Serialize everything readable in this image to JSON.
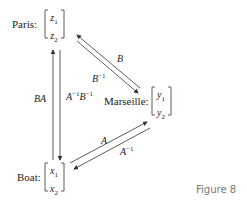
{
  "nodes": {
    "paris": {
      "label": "Paris:",
      "v1": "z",
      "v1_sub": "1",
      "v2": "z",
      "v2_sub": "2"
    },
    "marseille": {
      "label": "Marseille:",
      "v1": "y",
      "v1_sub": "1",
      "v2": "y",
      "v2_sub": "2"
    },
    "boat": {
      "label": "Boat:",
      "v1": "x",
      "v1_sub": "1",
      "v2": "x",
      "v2_sub": "2"
    }
  },
  "edges": {
    "boat_to_paris": {
      "label": "BA",
      "direction": "up"
    },
    "paris_to_boat": {
      "label": "A",
      "sup1": "−1",
      "label2": "B",
      "sup2": "−1",
      "direction": "down"
    },
    "marseille_to_paris": {
      "label": "B",
      "direction": "up-left"
    },
    "paris_to_marseille": {
      "label": "B",
      "sup": "−1",
      "direction": "down-right"
    },
    "boat_to_marseille": {
      "label": "A",
      "direction": "up-right"
    },
    "marseille_to_boat": {
      "label": "A",
      "sup": "−1",
      "direction": "down-left"
    }
  },
  "caption": "Figure 8",
  "colors": {
    "line": "#333333",
    "caption": "#777777"
  }
}
